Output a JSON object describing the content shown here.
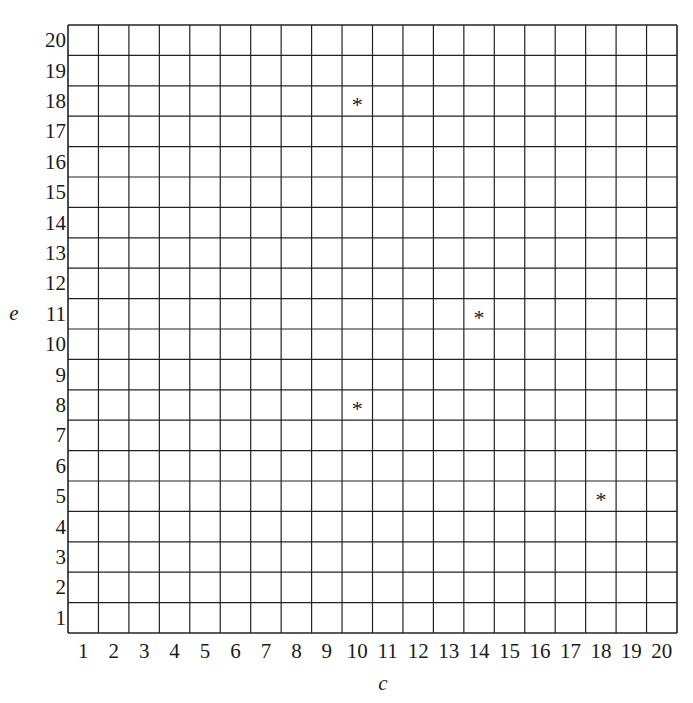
{
  "chart_data": {
    "type": "scatter",
    "title": "",
    "xlabel": "c",
    "ylabel": "e",
    "xlim": [
      1,
      20
    ],
    "ylim": [
      1,
      20
    ],
    "grid": true,
    "x_ticks": [
      1,
      2,
      3,
      4,
      5,
      6,
      7,
      8,
      9,
      10,
      11,
      12,
      13,
      14,
      15,
      16,
      17,
      18,
      19,
      20
    ],
    "y_ticks": [
      1,
      2,
      3,
      4,
      5,
      6,
      7,
      8,
      9,
      10,
      11,
      12,
      13,
      14,
      15,
      16,
      17,
      18,
      19,
      20
    ],
    "marker": "*",
    "points": [
      {
        "x": 10,
        "y": 18
      },
      {
        "x": 14,
        "y": 11
      },
      {
        "x": 10,
        "y": 8
      },
      {
        "x": 18,
        "y": 5
      }
    ],
    "legend": null
  }
}
